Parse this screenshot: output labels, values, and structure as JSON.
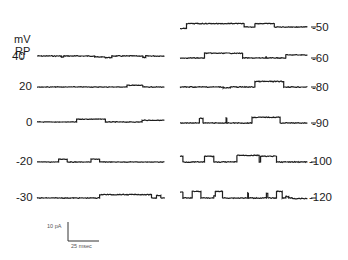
{
  "chart_data": {
    "type": "line",
    "title": "",
    "axis_label_top": "mV",
    "axis_label_sub": "RP",
    "axis_label_arrow": "+",
    "scale_bar": {
      "current_label": "10 pA",
      "current_value": 10,
      "time_label": "25 msec",
      "time_value": 25
    },
    "time_range_ms": [
      0,
      110
    ],
    "series": [
      {
        "name": "40",
        "column": "left",
        "steps": [
          [
            0,
            0
          ],
          [
            20,
            -0.6
          ],
          [
            22,
            0
          ],
          [
            48,
            -0.5
          ],
          [
            56,
            -0.8
          ],
          [
            62,
            0
          ],
          [
            88,
            -0.8
          ],
          [
            90,
            0
          ]
        ],
        "noise": 0.35
      },
      {
        "name": "20",
        "column": "left",
        "steps": [
          [
            0,
            0
          ],
          [
            75,
            0.9
          ],
          [
            88,
            0
          ]
        ],
        "noise": 0.25
      },
      {
        "name": "0",
        "column": "left",
        "steps": [
          [
            0,
            0
          ],
          [
            33,
            1.5
          ],
          [
            57,
            0
          ],
          [
            87,
            0.9
          ]
        ],
        "noise": 0.25
      },
      {
        "name": "-20",
        "column": "left",
        "steps": [
          [
            0,
            0
          ],
          [
            18,
            1.5
          ],
          [
            25,
            0
          ],
          [
            45,
            1.5
          ],
          [
            52,
            0
          ]
        ],
        "noise": 0.25
      },
      {
        "name": "-30",
        "column": "left",
        "steps": [
          [
            0,
            0
          ],
          [
            52,
            1.8
          ],
          [
            95,
            0
          ],
          [
            99,
            1.4
          ],
          [
            103,
            0
          ],
          [
            106,
            -0.3
          ]
        ],
        "noise": 0.3
      },
      {
        "name": "-50",
        "column": "right",
        "steps": [
          [
            0,
            -0.8
          ],
          [
            5,
            1.8
          ],
          [
            53,
            0
          ],
          [
            62,
            1.8
          ],
          [
            78,
            0
          ]
        ],
        "noise": 0.3
      },
      {
        "name": "-60",
        "column": "right",
        "steps": [
          [
            0,
            0
          ],
          [
            20,
            2.5
          ],
          [
            52,
            0
          ],
          [
            71,
            0.6
          ],
          [
            72,
            0
          ],
          [
            88,
            1.6
          ],
          [
            92,
            1.6
          ]
        ],
        "noise": 0.3
      },
      {
        "name": "-80",
        "column": "right",
        "steps": [
          [
            0,
            0
          ],
          [
            36,
            -0.4
          ],
          [
            42,
            0
          ],
          [
            62,
            2.9
          ],
          [
            86,
            0
          ]
        ],
        "noise": 0.4
      },
      {
        "name": "-90",
        "column": "right",
        "steps": [
          [
            0,
            0
          ],
          [
            16,
            2.5
          ],
          [
            19,
            0
          ],
          [
            38,
            2.6
          ],
          [
            39,
            0
          ],
          [
            60,
            3.0
          ],
          [
            83,
            0
          ]
        ],
        "noise": 0.3
      },
      {
        "name": "-100",
        "column": "right",
        "steps": [
          [
            0,
            3.0
          ],
          [
            2,
            0
          ],
          [
            20,
            3.0
          ],
          [
            28,
            0
          ],
          [
            47,
            3.5
          ],
          [
            66,
            0
          ],
          [
            67,
            3.0
          ],
          [
            80,
            0
          ]
        ],
        "noise": 0.35
      },
      {
        "name": "-120",
        "column": "right",
        "steps": [
          [
            0,
            3.0
          ],
          [
            2,
            0
          ],
          [
            10,
            3.5
          ],
          [
            17,
            0
          ],
          [
            28,
            1.0
          ],
          [
            29,
            3.5
          ],
          [
            35,
            0
          ],
          [
            56,
            2.5
          ],
          [
            57,
            0
          ],
          [
            72,
            2.5
          ],
          [
            73,
            0
          ],
          [
            80,
            3.5
          ],
          [
            85,
            0
          ],
          [
            88,
            0.8
          ],
          [
            90,
            0
          ],
          [
            93,
            -0.3
          ]
        ],
        "noise": 0.35
      }
    ]
  }
}
